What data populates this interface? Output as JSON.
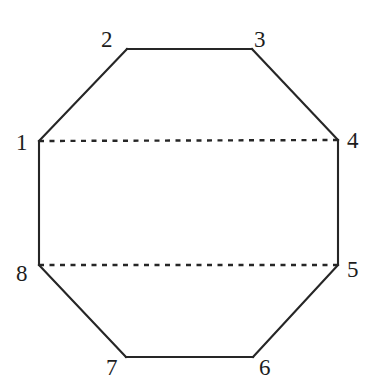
{
  "figure": {
    "kind": "geometric-diagram",
    "shape_name": "regular-octagon",
    "background_color": "#ffffff",
    "stroke_color": "#262626",
    "label_color": "#1d1d1d",
    "solid_stroke_width": 2.1,
    "dashed_stroke_width": 2.4,
    "dash_pattern": "5,5.5",
    "canvas": {
      "width": 378,
      "height": 391
    }
  },
  "chart_data": {
    "type": "scatter",
    "title": "",
    "xlabel": "",
    "ylabel": "",
    "xlim": [
      0,
      378
    ],
    "ylim": [
      391,
      0
    ],
    "grid": false,
    "legend": null,
    "annotations": [
      "Regular octagon with vertices numbered 1 through 8 clockwise starting at mid-left",
      "Two horizontal dashed chords: vertex 1 to vertex 4, and vertex 8 to vertex 5"
    ],
    "vertices": [
      {
        "id": 1,
        "label": "1",
        "x": 39,
        "y": 141,
        "label_x": 16,
        "label_y": 131,
        "label_anchor": "left"
      },
      {
        "id": 2,
        "label": "2",
        "x": 127,
        "y": 49,
        "label_x": 101,
        "label_y": 28,
        "label_anchor": "left"
      },
      {
        "id": 3,
        "label": "3",
        "x": 252,
        "y": 49,
        "label_x": 254,
        "label_y": 28,
        "label_anchor": "left"
      },
      {
        "id": 4,
        "label": "4",
        "x": 338,
        "y": 140,
        "label_x": 347,
        "label_y": 129,
        "label_anchor": "left"
      },
      {
        "id": 5,
        "label": "5",
        "x": 338,
        "y": 265,
        "label_x": 347,
        "label_y": 258,
        "label_anchor": "left"
      },
      {
        "id": 6,
        "label": "6",
        "x": 253,
        "y": 357,
        "label_x": 259,
        "label_y": 356,
        "label_anchor": "left"
      },
      {
        "id": 7,
        "label": "7",
        "x": 126,
        "y": 357,
        "label_x": 106,
        "label_y": 356,
        "label_anchor": "left"
      },
      {
        "id": 8,
        "label": "8",
        "x": 39,
        "y": 265,
        "label_x": 16,
        "label_y": 262,
        "label_anchor": "left"
      }
    ],
    "solid_edges": [
      {
        "from": 1,
        "to": 2
      },
      {
        "from": 2,
        "to": 3
      },
      {
        "from": 3,
        "to": 4
      },
      {
        "from": 4,
        "to": 5
      },
      {
        "from": 5,
        "to": 6
      },
      {
        "from": 6,
        "to": 7
      },
      {
        "from": 7,
        "to": 8
      },
      {
        "from": 8,
        "to": 1
      }
    ],
    "dashed_chords": [
      {
        "from": 1,
        "to": 4
      },
      {
        "from": 8,
        "to": 5
      }
    ]
  }
}
